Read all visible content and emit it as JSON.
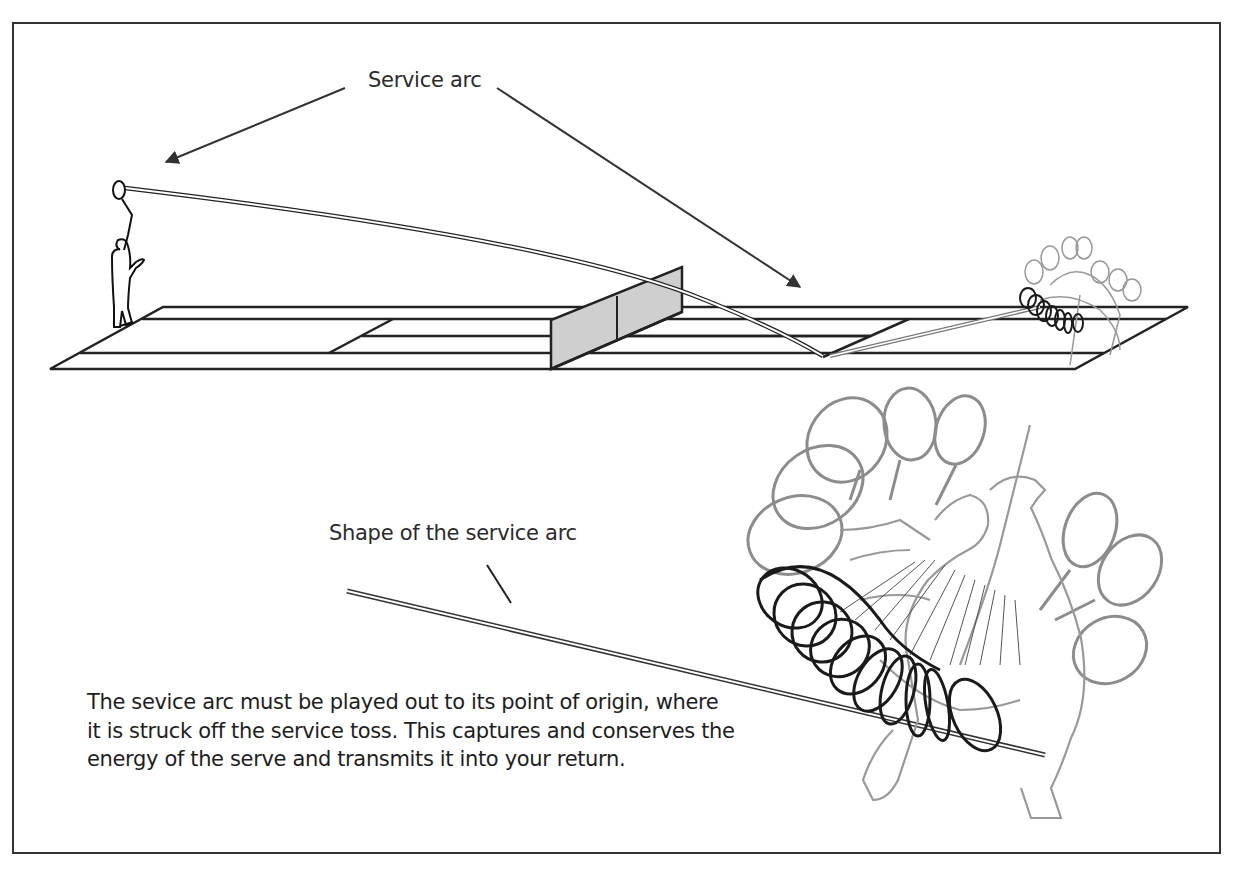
{
  "figure": {
    "colors": {
      "line": "#222222",
      "frame": "#333333",
      "net_fill": "#cfcfcf",
      "ghost_swing": "#8a8a8a",
      "racket_loops": "#1a1a1a"
    }
  },
  "labels": {
    "service_arc": "Service arc",
    "shape_of_arc": "Shape of the service arc"
  },
  "caption": {
    "lines": [
      "The sevice arc must be played out to its point of origin, where",
      "it is struck off the service toss.  This captures and conserves the",
      "energy of the serve and transmits it into your return."
    ]
  },
  "illustrations": {
    "court": "tennis-court-perspective",
    "server": "server-figure",
    "returner": "returner-swing-sequence-small",
    "swing_detail": "returner-swing-sequence-large"
  }
}
